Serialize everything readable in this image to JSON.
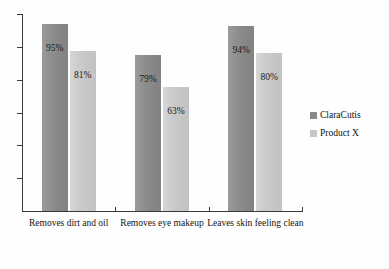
{
  "chart_data": {
    "type": "bar",
    "title": "",
    "subtitle": "",
    "xlabel": "",
    "ylabel": "",
    "ylim": [
      0,
      100
    ],
    "grid": false,
    "axis_tick_labels": [],
    "y_tick_count": 6,
    "legend_position": "right",
    "categories": [
      "Removes dirt and oil",
      "Removes eye makeup",
      "Leaves skin feeling clean"
    ],
    "series": [
      {
        "name": "ClaraCutis",
        "color": "#8a8a8a",
        "values": [
          95,
          79,
          94
        ],
        "labels": [
          "95%",
          "79%",
          "94%"
        ]
      },
      {
        "name": "Product X",
        "color": "#c6c6c6",
        "values": [
          81,
          63,
          80
        ],
        "labels": [
          "81%",
          "63%",
          "80%"
        ]
      }
    ]
  },
  "legend": {
    "items": [
      {
        "label": "ClaraCutis"
      },
      {
        "label": "Product X"
      }
    ]
  }
}
